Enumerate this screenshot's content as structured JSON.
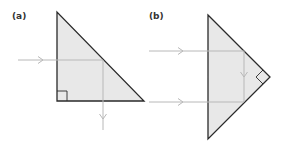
{
  "panels": [
    {
      "label": "(a)",
      "description": "Right-angle prism with the right angle at bottom-left; a horizontal ray is totally internally reflected at the hypotenuse and deviated 90° downward."
    },
    {
      "label": "(b)",
      "description": "Right-angle prism with the right angle at the right vertex; the top ray reflects twice off the two short faces and returns (deviated 180°)."
    }
  ],
  "colors": {
    "prism_fill": "#e8e8e8",
    "prism_outline": "#2a2a2a",
    "ray": "#b8b8b8",
    "label": "#333333"
  }
}
